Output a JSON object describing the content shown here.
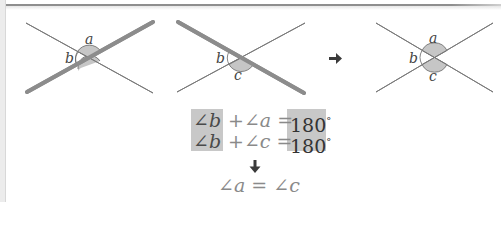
{
  "diagram": {
    "panels": [
      {
        "id": "panel-1",
        "highlighted_line": "rising",
        "angle_labels": {
          "top": "a",
          "left": "b"
        },
        "shaded_angles": [
          "a"
        ]
      },
      {
        "id": "panel-2",
        "highlighted_line": "falling",
        "angle_labels": {
          "left": "b",
          "bottom": "c"
        },
        "shaded_angles": [
          "c"
        ]
      },
      {
        "id": "panel-3",
        "highlighted_line": "none",
        "angle_labels": {
          "top": "a",
          "left": "b",
          "bottom": "c"
        },
        "shaded_angles": [
          "a",
          "c"
        ]
      }
    ],
    "labels": {
      "a": "a",
      "b": "b",
      "c": "c"
    },
    "right_arrow_icon": "arrow-right-icon",
    "down_arrow_icon": "arrow-down-icon",
    "colors": {
      "line": "#7a7a7a",
      "highlight_line": "#8c8c8c",
      "shade": "#c6c6c6",
      "highlight_box": "#c8c8c8",
      "text": "#4a4a4a"
    }
  },
  "equations": {
    "line1": {
      "left": "∠b",
      "middle": "+∠a =",
      "right": "180",
      "unit": "°"
    },
    "line2": {
      "left": "∠b",
      "middle": "+∠c =",
      "right": "180",
      "unit": "°"
    },
    "conclusion": "∠a = ∠c"
  }
}
